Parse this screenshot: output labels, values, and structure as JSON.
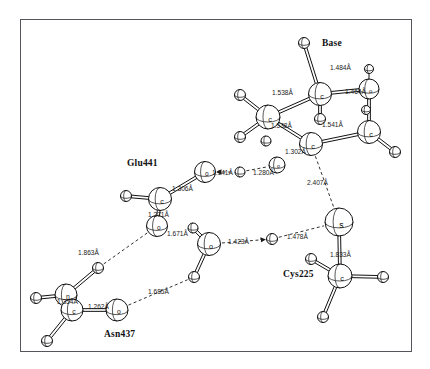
{
  "figure": {
    "kind": "molecular-structure-diagram",
    "background": "#ffffff",
    "frame_color": "#55565c"
  },
  "residue_labels": [
    {
      "name": "base-label",
      "text": "Base",
      "x": 322,
      "y": 38
    },
    {
      "name": "glu441-label",
      "text": "Glu441",
      "x": 127,
      "y": 158
    },
    {
      "name": "cys225-label",
      "text": "Cys225",
      "x": 283,
      "y": 269
    },
    {
      "name": "asn437-label",
      "text": "Asn437",
      "x": 104,
      "y": 329
    }
  ],
  "bond_labels": [
    {
      "name": "bond-1-484",
      "text": "1.484Å",
      "x": 330,
      "y": 64
    },
    {
      "name": "bond-1-464",
      "text": "1.464Å",
      "x": 345,
      "y": 88
    },
    {
      "name": "bond-1-538a",
      "text": "1.538Å",
      "x": 272,
      "y": 89
    },
    {
      "name": "bond-1-538b",
      "text": "1.538Å",
      "x": 271,
      "y": 122
    },
    {
      "name": "bond-1-541",
      "text": "1.541Å",
      "x": 322,
      "y": 121
    },
    {
      "name": "bond-1-302",
      "text": "1.302Å",
      "x": 285,
      "y": 148
    },
    {
      "name": "bond-2-407",
      "text": "2.407Å",
      "x": 307,
      "y": 179
    },
    {
      "name": "bond-1-141",
      "text": "1.141Å",
      "x": 212,
      "y": 169
    },
    {
      "name": "bond-1-280",
      "text": "1.280Å",
      "x": 253,
      "y": 169
    },
    {
      "name": "bond-1-306",
      "text": "1.306Å",
      "x": 172,
      "y": 185
    },
    {
      "name": "bond-1-271",
      "text": "1.271Å",
      "x": 148,
      "y": 211
    },
    {
      "name": "bond-1-671",
      "text": "1.671Å",
      "x": 167,
      "y": 230
    },
    {
      "name": "bond-1-423",
      "text": "1.423Å",
      "x": 228,
      "y": 238
    },
    {
      "name": "bond-1-478",
      "text": "1.478Å",
      "x": 287,
      "y": 233
    },
    {
      "name": "bond-1-833",
      "text": "1.833Å",
      "x": 330,
      "y": 251
    },
    {
      "name": "bond-1-863",
      "text": "1.863Å",
      "x": 78,
      "y": 249
    },
    {
      "name": "bond-1-685",
      "text": "1.685Å",
      "x": 148,
      "y": 288
    },
    {
      "name": "bond-1-354",
      "text": "1.354Å",
      "x": 57,
      "y": 298
    },
    {
      "name": "bond-1-262",
      "text": "1.262Å",
      "x": 88,
      "y": 303
    }
  ],
  "atoms": [
    {
      "name": "atom-h-base-top",
      "el": "",
      "x": 304,
      "y": 43,
      "r": 5.5
    },
    {
      "name": "atom-c-base-upper",
      "el": "c",
      "x": 320,
      "y": 94,
      "r": 11.5
    },
    {
      "name": "atom-h-base-ur",
      "el": "",
      "x": 320,
      "y": 119,
      "r": 5.5
    },
    {
      "name": "atom-o-base-right",
      "el": "o",
      "x": 369,
      "y": 89,
      "r": 10
    },
    {
      "name": "atom-h-o-base",
      "el": "",
      "x": 369,
      "y": 69,
      "r": 4.5
    },
    {
      "name": "atom-c-base-lr",
      "el": "c",
      "x": 369,
      "y": 132,
      "r": 11.5
    },
    {
      "name": "atom-h-base-lr1",
      "el": "",
      "x": 395,
      "y": 152,
      "r": 5.5
    },
    {
      "name": "atom-h-base-lr2",
      "el": "",
      "x": 366,
      "y": 110,
      "r": 4.5
    },
    {
      "name": "atom-c-base-left",
      "el": "c",
      "x": 268,
      "y": 117,
      "r": 12
    },
    {
      "name": "atom-h-bl-1",
      "el": "",
      "x": 240,
      "y": 95,
      "r": 5.5
    },
    {
      "name": "atom-h-bl-2",
      "el": "",
      "x": 240,
      "y": 137,
      "r": 5.5
    },
    {
      "name": "atom-h-bl-3",
      "el": "",
      "x": 266,
      "y": 141,
      "r": 5
    },
    {
      "name": "atom-c-base-low",
      "el": "c",
      "x": 311,
      "y": 144,
      "r": 11.5
    },
    {
      "name": "atom-o-small",
      "el": "o",
      "x": 277,
      "y": 165,
      "r": 8
    },
    {
      "name": "atom-o-glu-upper",
      "el": "o",
      "x": 205,
      "y": 172,
      "r": 10.5
    },
    {
      "name": "atom-h-mid",
      "el": "",
      "x": 240,
      "y": 172,
      "r": 5
    },
    {
      "name": "atom-c-glu",
      "el": "c",
      "x": 160,
      "y": 199,
      "r": 11.5
    },
    {
      "name": "atom-h-glu-left",
      "el": "",
      "x": 126,
      "y": 196,
      "r": 5.5
    },
    {
      "name": "atom-o-glu-lower",
      "el": "o",
      "x": 157,
      "y": 226,
      "r": 10.5
    },
    {
      "name": "atom-o-mid-low",
      "el": "o",
      "x": 209,
      "y": 244,
      "r": 11.5
    },
    {
      "name": "atom-h-omid",
      "el": "",
      "x": 193,
      "y": 228,
      "r": 5
    },
    {
      "name": "atom-h-omid-low",
      "el": "",
      "x": 194,
      "y": 277,
      "r": 5.5
    },
    {
      "name": "atom-h-bridge",
      "el": "",
      "x": 272,
      "y": 239,
      "r": 5.5
    },
    {
      "name": "atom-s-cys",
      "el": "s",
      "x": 339,
      "y": 222,
      "r": 14
    },
    {
      "name": "atom-c-cys",
      "el": "c",
      "x": 340,
      "y": 276,
      "r": 12
    },
    {
      "name": "atom-h-cys-1",
      "el": "",
      "x": 311,
      "y": 259,
      "r": 5.5
    },
    {
      "name": "atom-h-cys-2",
      "el": "",
      "x": 383,
      "y": 277,
      "r": 5.5
    },
    {
      "name": "atom-h-cys-3",
      "el": "",
      "x": 323,
      "y": 317,
      "r": 5.5
    },
    {
      "name": "atom-h-asn-up",
      "el": "",
      "x": 98,
      "y": 268,
      "r": 5.5
    },
    {
      "name": "atom-n-asn",
      "el": "n",
      "x": 66,
      "y": 295,
      "r": 11
    },
    {
      "name": "atom-h-asn-left",
      "el": "",
      "x": 36,
      "y": 298,
      "r": 5.5
    },
    {
      "name": "atom-c-asn",
      "el": "c",
      "x": 72,
      "y": 310,
      "r": 11
    },
    {
      "name": "atom-h-asn-low",
      "el": "",
      "x": 47,
      "y": 341,
      "r": 5.5
    },
    {
      "name": "atom-o-asn",
      "el": "o",
      "x": 117,
      "y": 310,
      "r": 11
    }
  ],
  "bonds": [
    {
      "name": "bond-base-top",
      "from": "atom-h-base-top",
      "to": "atom-c-base-upper",
      "style": "double"
    },
    {
      "name": "bond-cu-h",
      "from": "atom-c-base-upper",
      "to": "atom-h-base-ur",
      "style": "double"
    },
    {
      "name": "bond-cu-o",
      "from": "atom-c-base-upper",
      "to": "atom-o-base-right",
      "style": "double"
    },
    {
      "name": "bond-o-h",
      "from": "atom-o-base-right",
      "to": "atom-h-o-base",
      "style": "single"
    },
    {
      "name": "bond-o-clr",
      "from": "atom-o-base-right",
      "to": "atom-c-base-lr",
      "style": "double"
    },
    {
      "name": "bond-clr-h",
      "from": "atom-c-base-lr",
      "to": "atom-h-base-lr1",
      "style": "double"
    },
    {
      "name": "bond-cl-h1",
      "from": "atom-c-base-left",
      "to": "atom-h-bl-1",
      "style": "double"
    },
    {
      "name": "bond-cl-h2",
      "from": "atom-c-base-left",
      "to": "atom-h-bl-2",
      "style": "double"
    },
    {
      "name": "bond-cl-cu",
      "from": "atom-c-base-left",
      "to": "atom-c-base-upper",
      "style": "double"
    },
    {
      "name": "bond-cl-clow",
      "from": "atom-c-base-left",
      "to": "atom-c-base-low",
      "style": "double"
    },
    {
      "name": "bond-clow-clr",
      "from": "atom-c-base-low",
      "to": "atom-c-base-lr",
      "style": "double"
    },
    {
      "name": "bond-glu-o-c",
      "from": "atom-o-glu-upper",
      "to": "atom-c-glu",
      "style": "double"
    },
    {
      "name": "bond-glu-c-h",
      "from": "atom-c-glu",
      "to": "atom-h-glu-left",
      "style": "double"
    },
    {
      "name": "bond-glu-c-o",
      "from": "atom-c-glu",
      "to": "atom-o-glu-lower",
      "style": "double"
    },
    {
      "name": "bond-omid-h",
      "from": "atom-o-mid-low",
      "to": "atom-h-omid",
      "style": "double"
    },
    {
      "name": "bond-omid-hlow",
      "from": "atom-o-mid-low",
      "to": "atom-h-omid-low",
      "style": "double"
    },
    {
      "name": "bond-s-c",
      "from": "atom-s-cys",
      "to": "atom-c-cys",
      "style": "double"
    },
    {
      "name": "bond-cys-h1",
      "from": "atom-c-cys",
      "to": "atom-h-cys-1",
      "style": "double"
    },
    {
      "name": "bond-cys-h2",
      "from": "atom-c-cys",
      "to": "atom-h-cys-2",
      "style": "double"
    },
    {
      "name": "bond-cys-h3",
      "from": "atom-c-cys",
      "to": "atom-h-cys-3",
      "style": "double"
    },
    {
      "name": "bond-asn-n-h",
      "from": "atom-n-asn",
      "to": "atom-h-asn-up",
      "style": "double"
    },
    {
      "name": "bond-asn-n-hl",
      "from": "atom-n-asn",
      "to": "atom-h-asn-left",
      "style": "double"
    },
    {
      "name": "bond-asn-n-c",
      "from": "atom-n-asn",
      "to": "atom-c-asn",
      "style": "single"
    },
    {
      "name": "bond-asn-c-h",
      "from": "atom-c-asn",
      "to": "atom-h-asn-low",
      "style": "double"
    },
    {
      "name": "bond-asn-c-o",
      "from": "atom-c-asn",
      "to": "atom-o-asn",
      "style": "double"
    }
  ],
  "hbonds": [
    {
      "name": "hbond-base-to-s",
      "from": "atom-c-base-low",
      "to": "atom-s-cys",
      "arrow": "none"
    },
    {
      "name": "hbond-o-to-h",
      "from": "atom-o-glu-upper",
      "to": "atom-h-mid",
      "arrow": "start"
    },
    {
      "name": "hbond-h-to-o",
      "from": "atom-h-mid",
      "to": "atom-o-small",
      "arrow": "none"
    },
    {
      "name": "hbond-omid-to-h",
      "from": "atom-o-mid-low",
      "to": "atom-h-bridge",
      "arrow": "end"
    },
    {
      "name": "hbond-h-to-s",
      "from": "atom-h-bridge",
      "to": "atom-s-cys",
      "arrow": "none"
    },
    {
      "name": "hbond-oglu-to-h",
      "from": "atom-o-glu-lower",
      "to": "atom-h-asn-up",
      "arrow": "none"
    },
    {
      "name": "hbond-oasn-to-h",
      "from": "atom-o-asn",
      "to": "atom-h-omid-low",
      "arrow": "none"
    }
  ]
}
